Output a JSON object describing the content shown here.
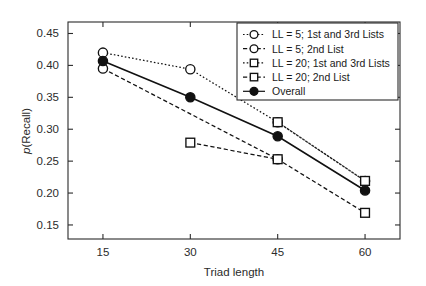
{
  "chart_data": {
    "type": "line",
    "title": "",
    "xlabel": "Triad length",
    "ylabel": "p(Recall)",
    "ylabel_italic_prefix": "p",
    "ylabel_rest": "(Recall)",
    "x": [
      15,
      30,
      45,
      60
    ],
    "xticklabels": [
      "15",
      "30",
      "45",
      "60"
    ],
    "yticks": [
      0.15,
      0.2,
      0.25,
      0.3,
      0.35,
      0.4,
      0.45
    ],
    "yticklabels": [
      "0.15",
      "0.20",
      "0.25",
      "0.30",
      "0.35",
      "0.40",
      "0.45"
    ],
    "xlim": [
      9,
      66
    ],
    "ylim": [
      0.128,
      0.468
    ],
    "grid": false,
    "legend_position": "top-right",
    "series": [
      {
        "name": "LL = 5; 1st and 3rd Lists",
        "marker": "open-circle",
        "linestyle": "dotted",
        "x": [
          15,
          30,
          45,
          60
        ],
        "values": [
          0.42,
          0.394,
          0.311,
          0.219
        ]
      },
      {
        "name": "LL = 5; 2nd List",
        "marker": "open-circle",
        "linestyle": "dashed",
        "x": [
          15,
          45
        ],
        "values": [
          0.395,
          0.253
        ]
      },
      {
        "name": "LL = 20; 1st and 3rd Lists",
        "marker": "open-square",
        "linestyle": "dotted",
        "x": [
          45,
          60
        ],
        "values": [
          0.311,
          0.219
        ]
      },
      {
        "name": "LL = 20; 2nd List",
        "marker": "open-square",
        "linestyle": "dashed",
        "x": [
          30,
          45,
          60
        ],
        "values": [
          0.279,
          0.253,
          0.169
        ]
      },
      {
        "name": "Overall",
        "marker": "filled-circle",
        "linestyle": "solid",
        "x": [
          15,
          30,
          45,
          60
        ],
        "values": [
          0.407,
          0.35,
          0.289,
          0.204
        ]
      }
    ],
    "legend": [
      {
        "label": "LL = 5; 1st and 3rd Lists",
        "marker": "open-circle",
        "linestyle": "dotted"
      },
      {
        "label": "LL = 5; 2nd List",
        "marker": "open-circle",
        "linestyle": "dashed"
      },
      {
        "label": "LL = 20; 1st and 3rd Lists",
        "marker": "open-square",
        "linestyle": "dotted"
      },
      {
        "label": "LL = 20; 2nd List",
        "marker": "open-square",
        "linestyle": "dashed"
      },
      {
        "label": "Overall",
        "marker": "filled-circle",
        "linestyle": "solid"
      }
    ],
    "colors": {
      "line": "#111111",
      "axis": "#2b2b2b",
      "background": "#ffffff",
      "marker_fill_open": "#ffffff",
      "marker_fill_closed": "#111111"
    }
  }
}
